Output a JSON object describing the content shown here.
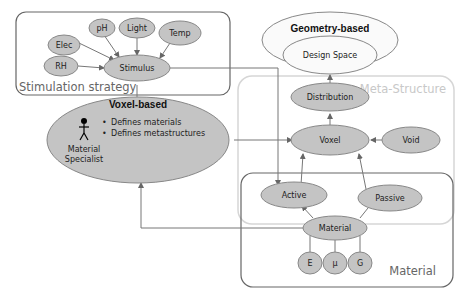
{
  "diagram": {
    "groups": {
      "stimulation": "Stimulation strategy",
      "meta_structure": "Meta-Structure",
      "material": "Material",
      "geometry": "Geometry-based",
      "voxel_based": "Voxel-based"
    },
    "nodes": {
      "elec": "Elec",
      "ph": "pH",
      "light": "Light",
      "temp": "Temp",
      "rh": "RH",
      "stimulus": "Stimulus",
      "design_space": "Design Space",
      "distribution": "Distribution",
      "voxel": "Voxel",
      "void": "Void",
      "active": "Active",
      "passive": "Passive",
      "material": "Material",
      "e": "E",
      "mu": "μ",
      "g": "G"
    },
    "voxel_based": {
      "bullets": [
        "Defines materials",
        "Defines metastructures"
      ],
      "actor_line1": "Material",
      "actor_line2": "Specialist"
    }
  },
  "colors": {
    "node_fill": "#c4c4c4",
    "group_border": "#777777",
    "meta_border": "#d0d0d0"
  }
}
